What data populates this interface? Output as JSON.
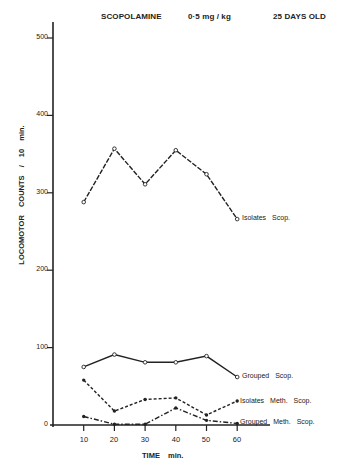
{
  "chart_data": {
    "type": "line",
    "title": "SCOPOLAMINE   0·5 mg / kg   25 DAYS OLD",
    "title_parts": [
      "SCOPOLAMINE",
      "0·5 mg / kg",
      "25 DAYS OLD"
    ],
    "xlabel": "TIME   min.",
    "ylabel": "LOCOMOTOR   COUNTS  /  10 min.",
    "x": [
      10,
      20,
      30,
      40,
      50,
      60
    ],
    "x_tick_labels": [
      "10",
      "20",
      "30",
      "40",
      "50",
      "60"
    ],
    "y_tick_labels": [
      "0",
      "100",
      "200",
      "300",
      "400",
      "500"
    ],
    "ylim": [
      0,
      500
    ],
    "xlim": [
      0,
      70
    ],
    "grid": false,
    "legend_position": "inline-right",
    "series": [
      {
        "name": "Isolates Scop.",
        "values": [
          288,
          357,
          311,
          355,
          324,
          266
        ],
        "line": "dashed-long",
        "marker": "open-circle"
      },
      {
        "name": "Grouped Scop.",
        "values": [
          75,
          91,
          81,
          81,
          89,
          62
        ],
        "line": "solid",
        "marker": "open-circle"
      },
      {
        "name": "Isolates Meth. Scop.",
        "values": [
          58,
          18,
          33,
          35,
          13,
          31
        ],
        "line": "dashed",
        "marker": "filled-circle"
      },
      {
        "name": "Grouped Meth. Scop.",
        "values": [
          11,
          1,
          1,
          22,
          6,
          2
        ],
        "line": "dash-dot",
        "marker": "filled-circle"
      }
    ]
  },
  "labels": {
    "title_1": "SCOPOLAMINE",
    "title_2": "0·5 mg / kg",
    "title_3": "25 DAYS OLD",
    "ylabel": "LOCOMOTOR   COUNTS  /  10 min.",
    "xlabel": "TIME   min.",
    "yticks": {
      "t0": "0",
      "t100": "100",
      "t200": "200",
      "t300": "300",
      "t400": "400",
      "t500": "500"
    },
    "xticks": {
      "t10": "10",
      "t20": "20",
      "t30": "30",
      "t40": "40",
      "t50": "50",
      "t60": "60"
    },
    "series": {
      "isolates_scop": "Isolates   Scop.",
      "grouped_scop": "Grouped   Scop.",
      "isolates_meth_scop": "Isolates  Meth. Scop.",
      "grouped_meth_scop": "Grouped  Meth. Scop."
    }
  }
}
